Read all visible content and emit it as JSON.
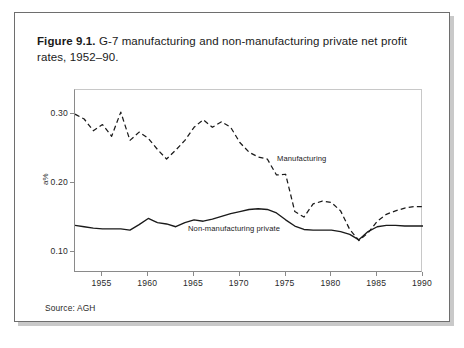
{
  "figure": {
    "label": "Figure 9.1.",
    "caption": " G-7 manufacturing and non-manufacturing private net profit rates, 1952–90.",
    "source": "Source: AGH"
  },
  "annotations": {
    "manufacturing": "Manufacturing",
    "non_manufacturing": "Non-manufacturing private"
  },
  "axis": {
    "y_label": "a%",
    "y_ticks": [
      "0.10",
      "0.20",
      "0.30"
    ],
    "x_ticks": [
      "1955",
      "1960",
      "1965",
      "1970",
      "1975",
      "1980",
      "1985",
      "1990"
    ]
  },
  "chart_data": {
    "type": "line",
    "xlabel": "",
    "ylabel": "a%",
    "xlim": [
      1952,
      1990
    ],
    "ylim": [
      0.07,
      0.335
    ],
    "grid": false,
    "legend": "inline-annotations",
    "x": [
      1952,
      1953,
      1954,
      1955,
      1956,
      1957,
      1958,
      1959,
      1960,
      1961,
      1962,
      1963,
      1964,
      1965,
      1966,
      1967,
      1968,
      1969,
      1970,
      1971,
      1972,
      1973,
      1974,
      1975,
      1976,
      1977,
      1978,
      1979,
      1980,
      1981,
      1982,
      1983,
      1984,
      1985,
      1986,
      1987,
      1988,
      1989,
      1990
    ],
    "series": [
      {
        "name": "Manufacturing",
        "style": "dashed",
        "color": "#1a1a1a",
        "values": [
          0.3,
          0.293,
          0.276,
          0.285,
          0.268,
          0.303,
          0.262,
          0.274,
          0.265,
          0.249,
          0.235,
          0.248,
          0.262,
          0.281,
          0.292,
          0.281,
          0.289,
          0.281,
          0.259,
          0.245,
          0.238,
          0.235,
          0.212,
          0.213,
          0.159,
          0.151,
          0.17,
          0.174,
          0.172,
          0.16,
          0.133,
          0.117,
          0.128,
          0.145,
          0.155,
          0.16,
          0.164,
          0.166,
          0.166
        ]
      },
      {
        "name": "Non-manufacturing private",
        "style": "solid",
        "color": "#1a1a1a",
        "values": [
          0.139,
          0.137,
          0.135,
          0.134,
          0.134,
          0.134,
          0.132,
          0.14,
          0.149,
          0.143,
          0.141,
          0.137,
          0.143,
          0.147,
          0.145,
          0.148,
          0.152,
          0.156,
          0.159,
          0.162,
          0.163,
          0.162,
          0.157,
          0.147,
          0.138,
          0.133,
          0.132,
          0.132,
          0.132,
          0.13,
          0.126,
          0.118,
          0.13,
          0.137,
          0.139,
          0.139,
          0.138,
          0.138,
          0.138
        ]
      }
    ]
  }
}
